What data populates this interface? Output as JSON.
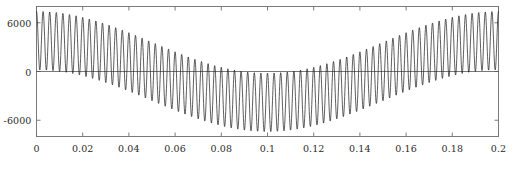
{
  "chart_data": {
    "type": "line",
    "title": "",
    "subtitle": "",
    "xlabel": "",
    "ylabel": "",
    "xlim": [
      0,
      0.2
    ],
    "ylim": [
      -8000,
      8000
    ],
    "grid": false,
    "legend": null,
    "xticks": [
      0,
      0.02,
      0.04,
      0.06,
      0.08,
      0.1,
      0.12,
      0.14,
      0.16,
      0.18,
      0.2
    ],
    "xtick_labels": [
      "0",
      "0.02",
      "0.04",
      "0.06",
      "0.08",
      "0.1",
      "0.12",
      "0.14",
      "0.16",
      "0.18",
      "0.2"
    ],
    "yticks": [
      6000,
      0,
      -6000
    ],
    "ytick_labels": [
      "6000",
      "0",
      "-6000"
    ],
    "series": [
      {
        "name": "zero-reference",
        "type": "line",
        "color": "#555555",
        "linewidth": 0.8,
        "x": [
          0,
          0.2
        ],
        "values": [
          0,
          0
        ]
      },
      {
        "name": "modulated-waveform",
        "type": "line",
        "color": "#1a1a1a",
        "linewidth": 0.7,
        "description": "High-frequency ripple riding on a slow sinusoidal envelope; peaks near +7400 at t=0 and t=0.19, trough minima near -7300 around t=0.08",
        "model": {
          "carrier_frequency_hz": 350,
          "carrier_amplitude": 3600,
          "envelope_frequency_hz": 5,
          "envelope_amplitude": 3800,
          "envelope_phase_deg": 0,
          "samples": 2400
        },
        "annotated_extrema": {
          "max_value": 7400,
          "max_at_t": 0.0,
          "min_value": -7300,
          "min_at_t": 0.08
        }
      }
    ]
  },
  "axes": {
    "frame_color": "#6e6e6e",
    "tick_color": "#6e6e6e",
    "background": "#ffffff"
  }
}
